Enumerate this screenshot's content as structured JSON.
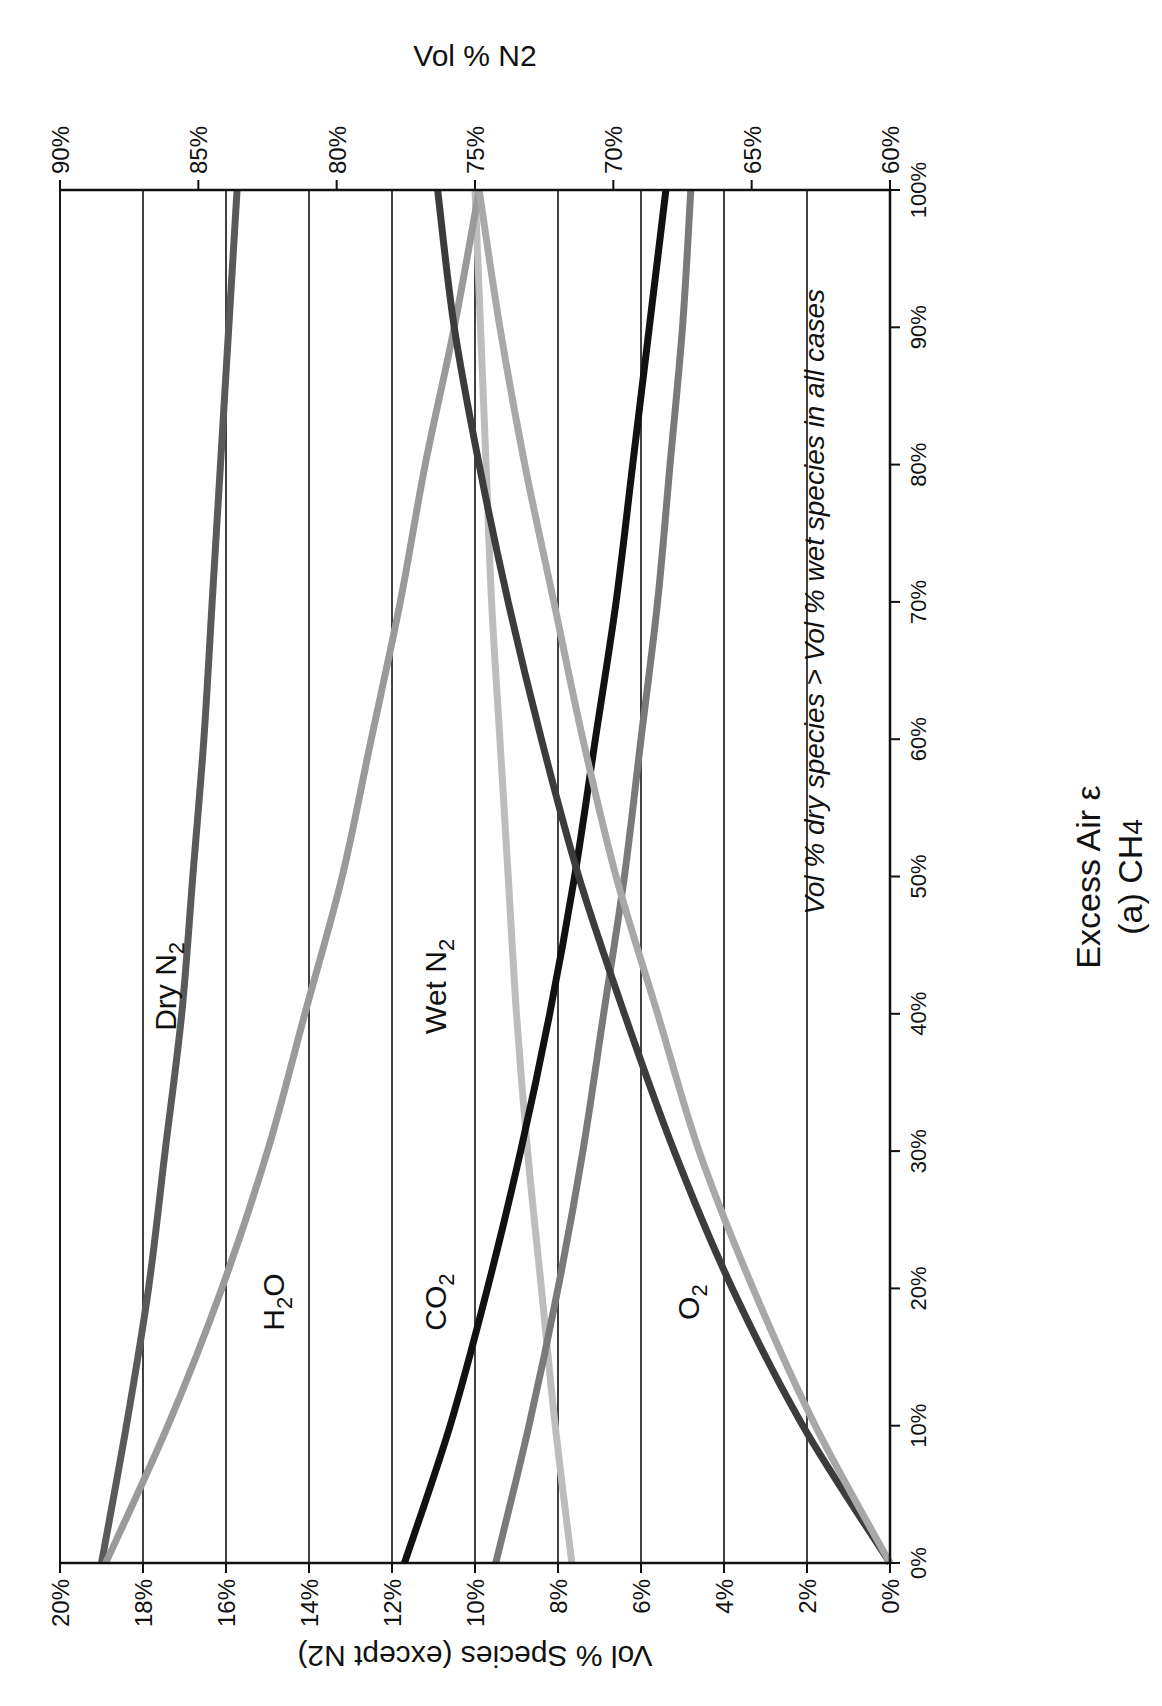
{
  "chart_data": {
    "type": "line",
    "title": "(a) CH4",
    "xlabel": "Excess Air ε",
    "ylabel": "Vol % Species (except N2)",
    "y2label": "Vol % N2",
    "xlim": [
      0,
      100
    ],
    "ylim": [
      0,
      20
    ],
    "y2lim": [
      60,
      90
    ],
    "grid": true,
    "x_ticks": [
      "0%",
      "10%",
      "20%",
      "30%",
      "40%",
      "50%",
      "60%",
      "70%",
      "80%",
      "90%",
      "100%"
    ],
    "y_ticks": [
      "0%",
      "2%",
      "4%",
      "6%",
      "8%",
      "10%",
      "12%",
      "14%",
      "16%",
      "18%",
      "20%"
    ],
    "y2_ticks": [
      "60%",
      "65%",
      "70%",
      "75%",
      "80%",
      "85%",
      "90%"
    ],
    "annotation": "Vol % dry species > Vol % wet species in all cases",
    "x": [
      0,
      10,
      20,
      30,
      40,
      50,
      60,
      70,
      80,
      90,
      100
    ],
    "series": [
      {
        "name": "Dry N2",
        "axis": "y2",
        "color": "#5a5a5a",
        "values": [
          88.5,
          87.6,
          86.8,
          86.2,
          85.6,
          85.2,
          84.8,
          84.5,
          84.2,
          83.9,
          83.6
        ]
      },
      {
        "name": "Wet N2",
        "axis": "y2",
        "color": "#bdbdbd",
        "values": [
          71.5,
          72.1,
          72.6,
          73.1,
          73.5,
          73.8,
          74.1,
          74.4,
          74.6,
          74.8,
          75.0
        ]
      },
      {
        "name": "H2O (wet)",
        "axis": "y",
        "color": "#9a9a9a",
        "values": [
          18.9,
          17.4,
          16.1,
          15.0,
          14.1,
          13.2,
          12.5,
          11.8,
          11.2,
          10.5,
          9.9
        ]
      },
      {
        "name": "CO2 (dry)",
        "axis": "y",
        "color": "#111111",
        "values": [
          11.7,
          10.6,
          9.7,
          8.9,
          8.2,
          7.6,
          7.1,
          6.6,
          6.2,
          5.8,
          5.4
        ]
      },
      {
        "name": "CO2 (wet)",
        "axis": "y",
        "color": "#7a7a7a",
        "values": [
          9.5,
          8.7,
          8.0,
          7.4,
          6.9,
          6.4,
          6.0,
          5.6,
          5.3,
          5.0,
          4.8
        ]
      },
      {
        "name": "O2 (dry)",
        "axis": "y",
        "color": "#3c3c3c",
        "values": [
          0,
          2.1,
          3.8,
          5.2,
          6.4,
          7.5,
          8.4,
          9.2,
          9.9,
          10.5,
          10.9
        ]
      },
      {
        "name": "O2 (wet)",
        "axis": "y",
        "color": "#a8a8a8",
        "values": [
          0,
          1.8,
          3.3,
          4.6,
          5.6,
          6.6,
          7.4,
          8.1,
          8.8,
          9.4,
          9.9
        ]
      }
    ],
    "series_labels": [
      {
        "text": "Dry N",
        "sub": "2",
        "x": 42,
        "y": 17.2
      },
      {
        "text": "H",
        "sub": "2",
        "tail": "O",
        "x": 19,
        "y": 14.6
      },
      {
        "text": "CO",
        "sub": "2",
        "x": 19,
        "y": 10.7
      },
      {
        "text": "Wet N",
        "sub": "2",
        "x": 42,
        "y": 10.7
      },
      {
        "text": "O",
        "sub": "2",
        "x": 19,
        "y": 4.6
      }
    ],
    "caption_line1": "Excess Air ε",
    "caption_line2": "(a) CH",
    "caption_line2_sub": "4"
  }
}
